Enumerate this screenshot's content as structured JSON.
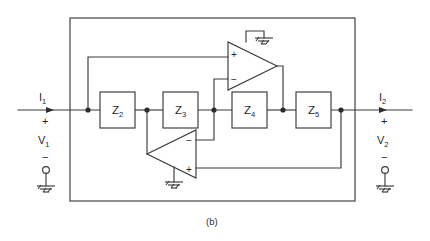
{
  "figure": {
    "caption": "(b)",
    "kind": "two-port-network-with-operational-amplifiers"
  },
  "colors": {
    "line": "#3a3a3a",
    "node": "#2b2b2b",
    "text": "#1f1f1f",
    "background": "#ffffff"
  },
  "ports": {
    "left": {
      "current_label": "I",
      "current_sub": "1",
      "plus": "+",
      "voltage_label": "V",
      "voltage_sub": "1",
      "minus": "−",
      "terminal": "ground-terminal"
    },
    "right": {
      "current_label": "I",
      "current_sub": "2",
      "plus": "+",
      "voltage_label": "V",
      "voltage_sub": "2",
      "minus": "−",
      "terminal": "ground-terminal"
    }
  },
  "impedances": [
    {
      "id": "z2",
      "label": "Z",
      "sub": "2"
    },
    {
      "id": "z3",
      "label": "Z",
      "sub": "3"
    },
    {
      "id": "z4",
      "label": "Z",
      "sub": "4"
    },
    {
      "id": "z5",
      "label": "Z",
      "sub": "5"
    }
  ],
  "opamps": [
    {
      "id": "upper",
      "orientation": "points-right",
      "top_input": "+",
      "bottom_input": "−",
      "has_ground": true
    },
    {
      "id": "lower",
      "orientation": "points-left",
      "top_input": "−",
      "bottom_input": "+",
      "has_ground": true
    }
  ],
  "icons": {
    "ground": "ground-icon",
    "node_dot": "junction-dot-icon",
    "current_arrow": "current-arrow-icon",
    "terminal": "terminal-circle-icon"
  }
}
